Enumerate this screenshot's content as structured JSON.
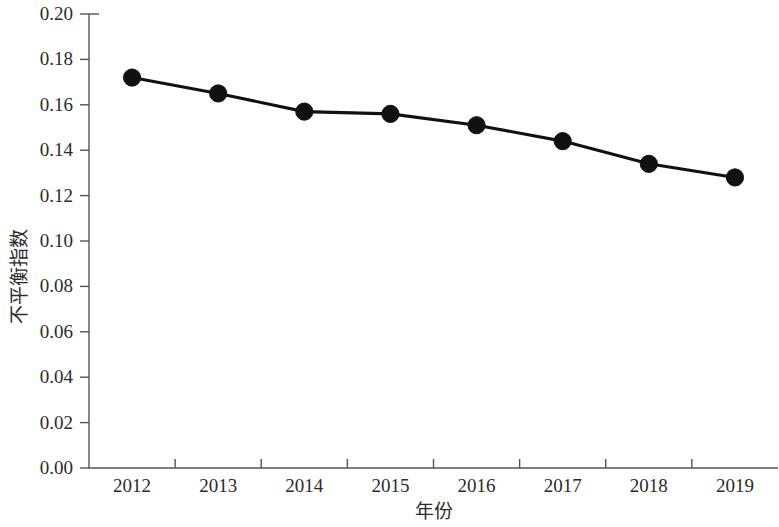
{
  "chart_data": {
    "type": "line",
    "title": "",
    "xlabel": "年份",
    "ylabel": "不平衡指数",
    "categories": [
      "2012",
      "2013",
      "2014",
      "2015",
      "2016",
      "2017",
      "2018",
      "2019"
    ],
    "x": [
      2012,
      2013,
      2014,
      2015,
      2016,
      2017,
      2018,
      2019
    ],
    "values": [
      0.172,
      0.165,
      0.157,
      0.156,
      0.151,
      0.144,
      0.134,
      0.128
    ],
    "series": [
      {
        "name": "不平衡指数",
        "values": [
          0.172,
          0.165,
          0.157,
          0.156,
          0.151,
          0.144,
          0.134,
          0.128
        ]
      }
    ],
    "ylim": [
      0.0,
      0.2
    ],
    "ytick_step": 0.02,
    "ytick_labels": [
      "0.00",
      "0.02",
      "0.04",
      "0.06",
      "0.08",
      "0.10",
      "0.12",
      "0.14",
      "0.16",
      "0.18",
      "0.20"
    ],
    "ytick_values": [
      0.0,
      0.02,
      0.04,
      0.06,
      0.08,
      0.1,
      0.12,
      0.14,
      0.16,
      0.18,
      0.2
    ],
    "xtick_labels": [
      "2012",
      "2013",
      "2014",
      "2015",
      "2016",
      "2017",
      "2018",
      "2019"
    ],
    "grid": false,
    "legend": "none",
    "line_color": "#111111",
    "marker_color": "#111111",
    "marker": "circle",
    "axis_color": "#555555"
  }
}
